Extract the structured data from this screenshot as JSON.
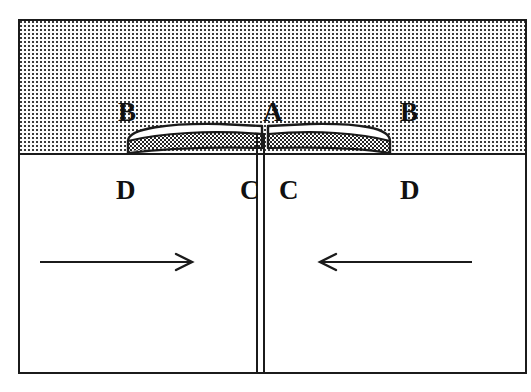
{
  "figure": {
    "caption": "",
    "title": "",
    "type": "cross-section schematic diagram",
    "background_color": "#ffffff",
    "line_color": "#1b1b1b"
  },
  "regions": {
    "upper": {
      "name": "stippled-upper-region",
      "fill": "stipple-dot-pattern",
      "fill_color": "#3a3a3a",
      "background_color": "#fdfdfd"
    },
    "lower": {
      "name": "white-lower-region",
      "fill": "solid-white",
      "background_color": "#ffffff"
    },
    "inclusion": {
      "name": "lens-shaped-inclusion",
      "fill_top": "#ffffff",
      "fill_bottom": "dense-stipple",
      "fill_bottom_color": "#2a2a2a"
    }
  },
  "labels": [
    {
      "id": "B-left",
      "text": "B",
      "x": 98,
      "y": 78
    },
    {
      "id": "A",
      "text": "A",
      "x": 243,
      "y": 78
    },
    {
      "id": "B-right",
      "text": "B",
      "x": 380,
      "y": 78
    },
    {
      "id": "D-left",
      "text": "D",
      "x": 96,
      "y": 156
    },
    {
      "id": "C-left",
      "text": "C",
      "x": 220,
      "y": 156
    },
    {
      "id": "C-right",
      "text": "C",
      "x": 259,
      "y": 156
    },
    {
      "id": "D-right",
      "text": "D",
      "x": 380,
      "y": 156
    }
  ],
  "label_text": {
    "B_left": "B",
    "A": "A",
    "B_right": "B",
    "D_left": "D",
    "C_left": "C",
    "C_right": "C",
    "D_right": "D"
  },
  "arrows": [
    {
      "id": "arrow-left",
      "direction": "right",
      "x": 20,
      "y": 228,
      "length": 160
    },
    {
      "id": "arrow-right",
      "direction": "left",
      "x": 292,
      "y": 228,
      "length": 160
    }
  ],
  "crack": {
    "name": "central-vertical-crack",
    "x": 236,
    "y": 112,
    "width": 9,
    "height": 241
  }
}
